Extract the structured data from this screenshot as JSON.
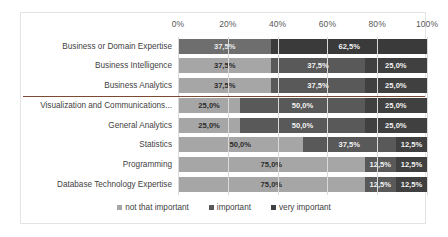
{
  "chart_data": {
    "type": "bar",
    "subtype": "horizontal-stacked-100",
    "title": "",
    "subtitle": "",
    "xlabel": "",
    "ylabel": "",
    "xlim": [
      0,
      100
    ],
    "grid": true,
    "legend_position": "bottom",
    "axis_tick_labels": [
      "0%",
      "20%",
      "40%",
      "60%",
      "80%",
      "100%"
    ],
    "axis_tick_values": [
      0,
      20,
      40,
      60,
      80,
      100
    ],
    "categories": [
      "Business or Domain Expertise",
      "Business Intelligence",
      "Business Analytics",
      "Visualization and Communications...",
      "General Analytics",
      "Statistics",
      "Programming",
      "Database Technology Expertise"
    ],
    "series": [
      {
        "name": "not that important",
        "color": "#a6a6a6",
        "values": [
          37.5,
          37.5,
          37.5,
          25.0,
          25.0,
          50.0,
          75.0,
          75.0
        ],
        "labels": [
          "37,5%",
          "37,5%",
          "37,5%",
          "25,0%",
          "25,0%",
          "50,0%",
          "75,0%",
          "75,0%"
        ]
      },
      {
        "name": "important",
        "color": "#595959",
        "values": [
          62.5,
          37.5,
          37.5,
          50.0,
          50.0,
          37.5,
          12.5,
          12.5
        ],
        "labels": [
          "62,5%",
          "37,5%",
          "37,5%",
          "50,0%",
          "50,0%",
          "37,5%",
          "12,5%",
          "12,5%"
        ]
      },
      {
        "name": "very important",
        "color": "#404040",
        "values": [
          0,
          25.0,
          25.0,
          25.0,
          25.0,
          12.5,
          12.5,
          12.5
        ],
        "labels": [
          "",
          "25,0%",
          "25,0%",
          "25,0%",
          "25,0%",
          "12,5%",
          "12,5%",
          "12,5%"
        ]
      }
    ],
    "divider_after_category_index": 2,
    "divider_color": "#7a4a32"
  },
  "legend": {
    "items": [
      {
        "label": "not that important"
      },
      {
        "label": "important"
      },
      {
        "label": "very important"
      }
    ]
  }
}
